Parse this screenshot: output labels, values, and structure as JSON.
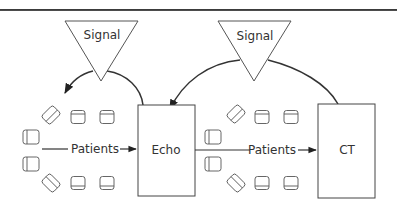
{
  "diagram": {
    "type": "patient-flow",
    "signals": [
      {
        "id": "signal-1",
        "label": "Signal"
      },
      {
        "id": "signal-2",
        "label": "Signal"
      }
    ],
    "stations": [
      {
        "id": "echo",
        "label": "Echo"
      },
      {
        "id": "ct",
        "label": "CT"
      }
    ],
    "flows": [
      {
        "label": "Patients",
        "from": "waiting-area-1",
        "to": "echo"
      },
      {
        "label": "Patients",
        "from": "waiting-area-2",
        "to": "ct"
      }
    ],
    "waiting_areas": [
      {
        "id": "waiting-area-1",
        "chair_count": 8
      },
      {
        "id": "waiting-area-2",
        "chair_count": 8
      }
    ],
    "feedback_links": [
      {
        "from": "echo",
        "via": "signal-1",
        "to": "waiting-area-1"
      },
      {
        "from": "ct",
        "via": "signal-2",
        "to": "echo"
      }
    ],
    "colors": {
      "stroke": "#333333",
      "background": "#ffffff"
    }
  }
}
